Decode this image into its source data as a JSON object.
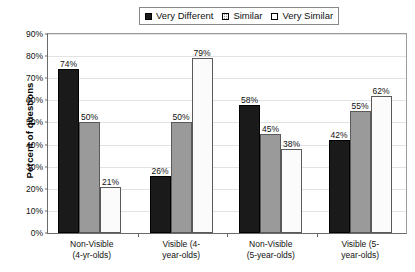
{
  "chart_data": {
    "type": "bar",
    "title": "",
    "xlabel": "",
    "ylabel": "Percent of questions",
    "ylim": [
      0,
      90
    ],
    "ytick_labels": [
      "0%",
      "10%",
      "20%",
      "30%",
      "40%",
      "50%",
      "60%",
      "70%",
      "80%",
      "90%"
    ],
    "ytick_values": [
      0,
      10,
      20,
      30,
      40,
      50,
      60,
      70,
      80,
      90
    ],
    "grid": true,
    "legend_position": "top-center",
    "categories": [
      "Non-Visible (4-yr-olds)",
      "Visible (4-year-olds)",
      "Non-Visible (5-year-olds)",
      "Visible (5-year-olds)"
    ],
    "category_lines": [
      [
        "Non-Visible",
        "(4-yr-olds)"
      ],
      [
        "Visible (4-",
        "year-olds)"
      ],
      [
        "Non-Visible",
        "(5-year-olds)"
      ],
      [
        "Visible (5-",
        "year-olds)"
      ]
    ],
    "series": [
      {
        "name": "Very Different",
        "fill": "solid-black",
        "color": "#1a1a1a",
        "values": [
          74,
          26,
          58,
          42
        ],
        "value_labels": [
          "74%",
          "26%",
          "58%",
          "42%"
        ]
      },
      {
        "name": "Similar",
        "fill": "solid-gray",
        "color": "#9a9a9a",
        "values": [
          50,
          50,
          45,
          55
        ],
        "value_labels": [
          "50%",
          "50%",
          "45%",
          "55%"
        ]
      },
      {
        "name": "Very Similar",
        "fill": "dotted-white",
        "color": "#ffffff",
        "values": [
          21,
          79,
          38,
          62
        ],
        "value_labels": [
          "21%",
          "79%",
          "38%",
          "62%"
        ]
      }
    ]
  }
}
